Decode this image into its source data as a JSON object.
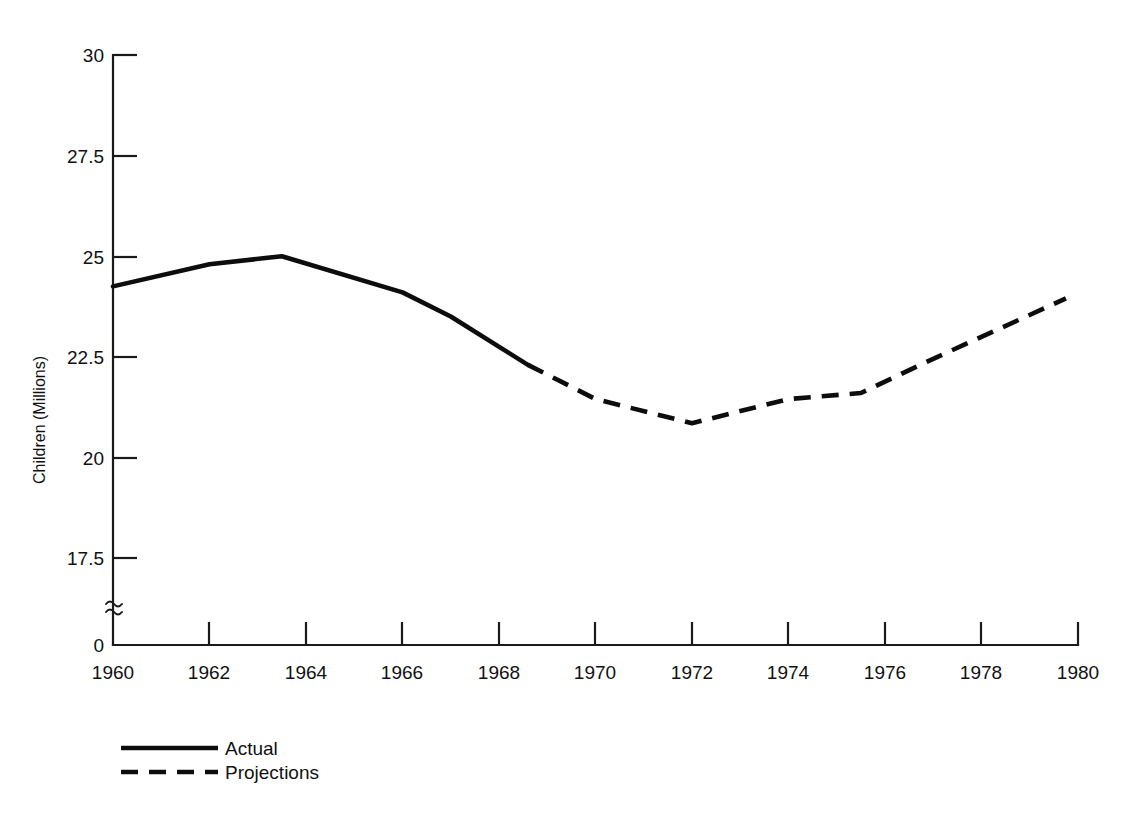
{
  "chart_data": {
    "type": "line",
    "title": "",
    "xlabel": "",
    "ylabel": "Children (Millions)",
    "xlim": [
      1960,
      1980
    ],
    "ylim": [
      17.5,
      30
    ],
    "y_axis_break": true,
    "y_axis_break_symbol": "≈",
    "grid": false,
    "legend_position": "bottom-left",
    "x_ticks": [
      "1960",
      "1962",
      "1964",
      "1966",
      "1968",
      "1970",
      "1972",
      "1974",
      "1976",
      "1978",
      "1980"
    ],
    "x_tick_values": [
      1960,
      1962,
      1964,
      1966,
      1968,
      1970,
      1972,
      1974,
      1976,
      1978,
      1980
    ],
    "y_ticks": [
      "0",
      "17.5",
      "20",
      "22.5",
      "25",
      "27.5",
      "30"
    ],
    "y_tick_values": [
      0,
      17.5,
      20,
      22.5,
      25,
      27.5,
      30
    ],
    "series": [
      {
        "name": "Actual",
        "style": "solid",
        "color": "#0d0d0d",
        "x": [
          1960,
          1962,
          1963.5,
          1966,
          1967,
          1968.6
        ],
        "values": [
          24.25,
          24.8,
          25.0,
          24.1,
          23.5,
          22.3
        ]
      },
      {
        "name": "Projections",
        "style": "dashed",
        "color": "#0d0d0d",
        "x": [
          1968.6,
          1970,
          1972,
          1974,
          1975.5,
          1977,
          1979.75
        ],
        "values": [
          22.3,
          21.45,
          20.85,
          21.45,
          21.6,
          22.45,
          23.95
        ]
      }
    ],
    "legend": [
      {
        "label": "Actual",
        "style": "solid"
      },
      {
        "label": "Projections",
        "style": "dashed"
      }
    ]
  },
  "axis": {
    "y_label": "Children (Millions)",
    "y_tick_30": "30",
    "y_tick_275": "27.5",
    "y_tick_25": "25",
    "y_tick_225": "22.5",
    "y_tick_20": "20",
    "y_tick_175": "17.5",
    "y_tick_0": "0",
    "break_glyph": "≈",
    "x_tick_1960": "1960",
    "x_tick_1962": "1962",
    "x_tick_1964": "1964",
    "x_tick_1966": "1966",
    "x_tick_1968": "1968",
    "x_tick_1970": "1970",
    "x_tick_1972": "1972",
    "x_tick_1974": "1974",
    "x_tick_1976": "1976",
    "x_tick_1978": "1978",
    "x_tick_1980": "1980"
  },
  "legend": {
    "actual_label": "Actual",
    "projections_label": "Projections"
  }
}
